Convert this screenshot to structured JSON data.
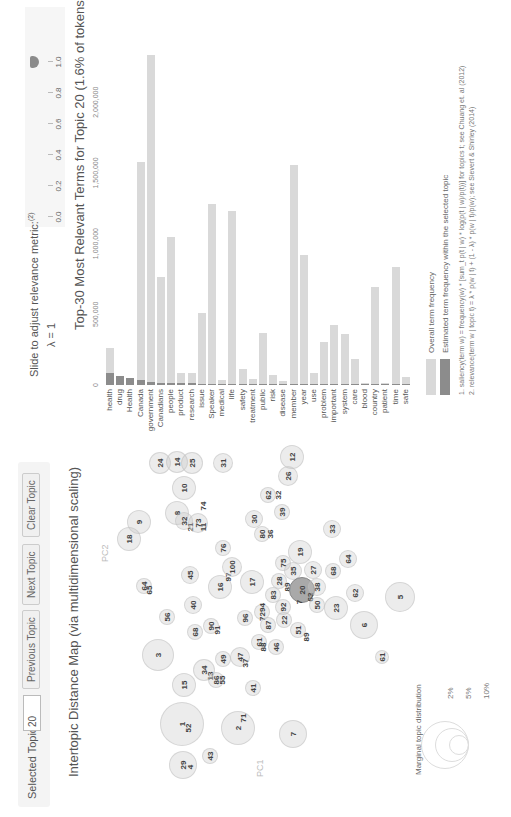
{
  "controls": {
    "selected_topic_label": "Selected Topic:",
    "selected_topic_value": "20",
    "previous_label": "Previous Topic",
    "next_label": "Next Topic",
    "clear_label": "Clear Topic"
  },
  "map": {
    "title": "Intertopic Distance Map (via multidimensional scaling)",
    "pc1_label": "PC1",
    "pc2_label": "PC2",
    "selected_topic": "20",
    "circles": [
      {
        "label": "1",
        "u": 93,
        "v": 182,
        "r": 22
      },
      {
        "label": "52",
        "u": 89,
        "v": 188,
        "r": 0
      },
      {
        "label": "2",
        "u": 89,
        "v": 238,
        "r": 17
      },
      {
        "label": "71",
        "u": 99,
        "v": 243,
        "r": 0
      },
      {
        "label": "3",
        "u": 162,
        "v": 158,
        "r": 16
      },
      {
        "label": "29",
        "u": 52,
        "v": 183,
        "r": 14
      },
      {
        "label": "4",
        "u": 50,
        "v": 190,
        "r": 0
      },
      {
        "label": "43",
        "u": 61,
        "v": 210,
        "r": 8
      },
      {
        "label": "15",
        "u": 132,
        "v": 184,
        "r": 12
      },
      {
        "label": "34",
        "u": 147,
        "v": 204,
        "r": 11
      },
      {
        "label": "13",
        "u": 141,
        "v": 210,
        "r": 0
      },
      {
        "label": "86",
        "u": 137,
        "v": 216,
        "r": 8
      },
      {
        "label": "55",
        "u": 137,
        "v": 222,
        "r": 0
      },
      {
        "label": "49",
        "u": 158,
        "v": 223,
        "r": 8
      },
      {
        "label": "47",
        "u": 160,
        "v": 240,
        "r": 10
      },
      {
        "label": "37",
        "u": 154,
        "v": 245,
        "r": 0
      },
      {
        "label": "41",
        "u": 129,
        "v": 253,
        "r": 8
      },
      {
        "label": "7",
        "u": 83,
        "v": 293,
        "r": 14
      },
      {
        "label": "56",
        "u": 200,
        "v": 167,
        "r": 8
      },
      {
        "label": "68",
        "u": 185,
        "v": 195,
        "r": 8
      },
      {
        "label": "90",
        "u": 191,
        "v": 211,
        "r": 8
      },
      {
        "label": "91",
        "u": 187,
        "v": 217,
        "r": 0
      },
      {
        "label": "96",
        "u": 199,
        "v": 245,
        "r": 8
      },
      {
        "label": "7294",
        "u": 205,
        "v": 262,
        "r": 8
      },
      {
        "label": "61",
        "u": 175,
        "v": 259,
        "r": 8
      },
      {
        "label": "88",
        "u": 170,
        "v": 263,
        "r": 0
      },
      {
        "label": "46",
        "u": 170,
        "v": 276,
        "r": 8
      },
      {
        "label": "87",
        "u": 192,
        "v": 268,
        "r": 8
      },
      {
        "label": "45",
        "u": 242,
        "v": 190,
        "r": 9
      },
      {
        "label": "40",
        "u": 212,
        "v": 193,
        "r": 9
      },
      {
        "label": "64",
        "u": 231,
        "v": 144,
        "r": 8
      },
      {
        "label": "65",
        "u": 227,
        "v": 149,
        "r": 0
      },
      {
        "label": "16",
        "u": 230,
        "v": 220,
        "r": 12
      },
      {
        "label": "97",
        "u": 240,
        "v": 228,
        "r": 0
      },
      {
        "label": "100",
        "u": 250,
        "v": 232,
        "r": 10
      },
      {
        "label": "76",
        "u": 269,
        "v": 223,
        "r": 8
      },
      {
        "label": "17",
        "u": 235,
        "v": 252,
        "r": 12
      },
      {
        "label": "83",
        "u": 222,
        "v": 273,
        "r": 8
      },
      {
        "label": "92",
        "u": 210,
        "v": 283,
        "r": 8
      },
      {
        "label": "22",
        "u": 197,
        "v": 284,
        "r": 8
      },
      {
        "label": "51",
        "u": 187,
        "v": 298,
        "r": 8
      },
      {
        "label": "89",
        "u": 180,
        "v": 306,
        "r": 0
      },
      {
        "label": "28",
        "u": 236,
        "v": 279,
        "r": 8
      },
      {
        "label": "89",
        "u": 230,
        "v": 287,
        "r": 0
      },
      {
        "label": "75",
        "u": 254,
        "v": 283,
        "r": 8
      },
      {
        "label": "35",
        "u": 246,
        "v": 293,
        "r": 9
      },
      {
        "label": "19",
        "u": 265,
        "v": 300,
        "r": 12
      },
      {
        "label": "20",
        "u": 227,
        "v": 302,
        "r": 13,
        "selected": true
      },
      {
        "label": "63",
        "u": 220,
        "v": 310,
        "r": 0
      },
      {
        "label": "7",
        "u": 215,
        "v": 299,
        "r": 0
      },
      {
        "label": "27",
        "u": 247,
        "v": 313,
        "r": 9
      },
      {
        "label": "38",
        "u": 230,
        "v": 317,
        "r": 9
      },
      {
        "label": "50",
        "u": 212,
        "v": 317,
        "r": 8
      },
      {
        "label": "68",
        "u": 246,
        "v": 333,
        "r": 8
      },
      {
        "label": "23",
        "u": 209,
        "v": 336,
        "r": 12
      },
      {
        "label": "62",
        "u": 224,
        "v": 355,
        "r": 9
      },
      {
        "label": "64",
        "u": 258,
        "v": 348,
        "r": 9
      },
      {
        "label": "6",
        "u": 192,
        "v": 364,
        "r": 14
      },
      {
        "label": "5",
        "u": 220,
        "v": 400,
        "r": 15
      },
      {
        "label": "61",
        "u": 160,
        "v": 382,
        "r": 7
      },
      {
        "label": "33",
        "u": 288,
        "v": 332,
        "r": 9
      },
      {
        "label": "24",
        "u": 354,
        "v": 160,
        "r": 11
      },
      {
        "label": "14",
        "u": 355,
        "v": 177,
        "r": 11
      },
      {
        "label": "25",
        "u": 354,
        "v": 192,
        "r": 11
      },
      {
        "label": "31",
        "u": 354,
        "v": 223,
        "r": 10
      },
      {
        "label": "10",
        "u": 329,
        "v": 184,
        "r": 12
      },
      {
        "label": "74",
        "u": 311,
        "v": 203,
        "r": 0
      },
      {
        "label": "8",
        "u": 304,
        "v": 177,
        "r": 12
      },
      {
        "label": "32",
        "u": 296,
        "v": 184,
        "r": 9
      },
      {
        "label": "21",
        "u": 290,
        "v": 190,
        "r": 0
      },
      {
        "label": "73",
        "u": 294,
        "v": 198,
        "r": 10
      },
      {
        "label": "11",
        "u": 290,
        "v": 203,
        "r": 0
      },
      {
        "label": "9",
        "u": 295,
        "v": 139,
        "r": 12
      },
      {
        "label": "18",
        "u": 278,
        "v": 129,
        "r": 12
      },
      {
        "label": "30",
        "u": 298,
        "v": 254,
        "r": 9
      },
      {
        "label": "80",
        "u": 283,
        "v": 262,
        "r": 8
      },
      {
        "label": "36",
        "u": 283,
        "v": 270,
        "r": 0
      },
      {
        "label": "62",
        "u": 322,
        "v": 268,
        "r": 8
      },
      {
        "label": "32",
        "u": 322,
        "v": 278,
        "r": 0
      },
      {
        "label": "39",
        "u": 305,
        "v": 282,
        "r": 8
      },
      {
        "label": "26",
        "u": 341,
        "v": 288,
        "r": 10
      },
      {
        "label": "12",
        "u": 360,
        "v": 292,
        "r": 12
      }
    ],
    "legend": {
      "title": "Marginal topic distribution",
      "sizes": [
        {
          "label": "2%",
          "r": 10
        },
        {
          "label": "5%",
          "r": 17
        },
        {
          "label": "10%",
          "r": 24
        }
      ]
    }
  },
  "slider": {
    "label": "Slide to adjust relevance metric:",
    "footnote_ref": "(2)",
    "lambda_label": "λ = 1",
    "value": 1.0,
    "ticks": [
      "0.0",
      "0.2",
      "0.4",
      "0.6",
      "0.8",
      "1.0"
    ]
  },
  "bars": {
    "title": "Top-30 Most Relevant Terms for Topic 20 (1.6% of tokens)",
    "axis_ticks": [
      "0",
      "500,000",
      "1,000,000",
      "1,500,000",
      "2,000,000"
    ],
    "legend": {
      "overall_label": "Overall term frequency",
      "topic_label": "Estimated term frequency within the selected topic",
      "overall_color": "#d9d9d9",
      "topic_color": "#8c8c8c"
    },
    "footnotes": [
      "1. saliency(term w) = frequency(w) * [sum_t p(t | w) * log(p(t | w)/p(t))] for topics t; see Chuang et. al (2012)",
      "2. relevance(term w | topic t) = λ * p(w | t) + (1 - λ) * p(w | t)/p(w); see Sievert & Shirley (2014)"
    ]
  },
  "chart_data": {
    "type": "bar",
    "title": "Top-30 Most Relevant Terms for Topic 20 (1.6% of tokens)",
    "xlabel": "",
    "ylabel": "",
    "xlim": [
      0,
      2400000
    ],
    "orientation": "horizontal",
    "categories": [
      "health",
      "drug",
      "Health",
      "Canada",
      "government",
      "Canadians",
      "people",
      "product",
      "research",
      "issue",
      "Speaker",
      "medical",
      "life",
      "safety",
      "treatment",
      "public",
      "risk",
      "disease",
      "member",
      "year",
      "use",
      "problem",
      "important",
      "system",
      "care",
      "blood",
      "country",
      "patient",
      "time",
      "safe"
    ],
    "series": [
      {
        "name": "Overall term frequency",
        "values": [
          259000,
          64000,
          47000,
          1575000,
          2335000,
          767000,
          1050000,
          87000,
          87000,
          507000,
          1281000,
          35000,
          1233000,
          111000,
          40000,
          370000,
          71000,
          28000,
          1557000,
          920000,
          83000,
          307000,
          425000,
          361000,
          184000,
          12000,
          696000,
          12000,
          833000,
          59000
        ]
      },
      {
        "name": "Estimated term frequency within the selected topic",
        "values": [
          87000,
          64000,
          47000,
          35000,
          24000,
          14000,
          12000,
          12000,
          11000,
          10000,
          9000,
          9000,
          8000,
          8000,
          8000,
          7000,
          7000,
          7000,
          6000,
          6000,
          6000,
          5000,
          5000,
          5000,
          5000,
          4000,
          4000,
          4000,
          4000,
          4000
        ]
      }
    ]
  }
}
